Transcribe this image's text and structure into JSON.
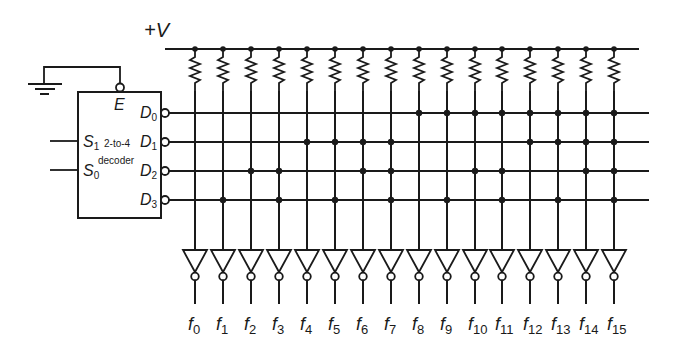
{
  "diagram": {
    "title": "",
    "supply_label": "+V",
    "decoder": {
      "type_line1": "2-to-4",
      "type_line2": "decoder",
      "enable": "E",
      "enable_active_low": true,
      "enable_connected_to": "ground",
      "inputs": [
        {
          "name": "S",
          "sub": "1"
        },
        {
          "name": "S",
          "sub": "0"
        }
      ],
      "outputs": [
        {
          "name": "D",
          "sub": "0"
        },
        {
          "name": "D",
          "sub": "1"
        },
        {
          "name": "D",
          "sub": "2"
        },
        {
          "name": "D",
          "sub": "3"
        }
      ],
      "outputs_active_low": true
    },
    "columns": [
      {
        "label": "f",
        "sub": "0",
        "dots": [
          0,
          0,
          0,
          0
        ]
      },
      {
        "label": "f",
        "sub": "1",
        "dots": [
          0,
          0,
          0,
          1
        ]
      },
      {
        "label": "f",
        "sub": "2",
        "dots": [
          0,
          0,
          1,
          0
        ]
      },
      {
        "label": "f",
        "sub": "3",
        "dots": [
          0,
          0,
          1,
          1
        ]
      },
      {
        "label": "f",
        "sub": "4",
        "dots": [
          0,
          1,
          0,
          0
        ]
      },
      {
        "label": "f",
        "sub": "5",
        "dots": [
          0,
          1,
          0,
          1
        ]
      },
      {
        "label": "f",
        "sub": "6",
        "dots": [
          0,
          1,
          1,
          0
        ]
      },
      {
        "label": "f",
        "sub": "7",
        "dots": [
          0,
          1,
          1,
          1
        ]
      },
      {
        "label": "f",
        "sub": "8",
        "dots": [
          1,
          0,
          0,
          0
        ]
      },
      {
        "label": "f",
        "sub": "9",
        "dots": [
          1,
          0,
          0,
          1
        ]
      },
      {
        "label": "f",
        "sub": "10",
        "dots": [
          1,
          0,
          1,
          0
        ]
      },
      {
        "label": "f",
        "sub": "11",
        "dots": [
          1,
          0,
          1,
          1
        ]
      },
      {
        "label": "f",
        "sub": "12",
        "dots": [
          1,
          1,
          0,
          0
        ]
      },
      {
        "label": "f",
        "sub": "13",
        "dots": [
          1,
          1,
          0,
          1
        ]
      },
      {
        "label": "f",
        "sub": "14",
        "dots": [
          1,
          1,
          1,
          0
        ]
      },
      {
        "label": "f",
        "sub": "15",
        "dots": [
          1,
          1,
          1,
          1
        ]
      }
    ],
    "column_elements": {
      "pullup": "resistor",
      "output_buffer": "inverter"
    },
    "colors": {
      "ink": "#1a1a1a",
      "background": "#ffffff"
    }
  }
}
